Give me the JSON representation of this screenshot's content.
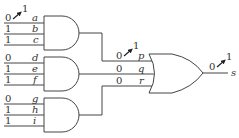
{
  "diagram": {
    "type": "logic-circuit",
    "and_gates": [
      {
        "id": "and-1",
        "inputs": [
          {
            "name": "a",
            "value": "0",
            "changed_to": "1"
          },
          {
            "name": "b",
            "value": "1"
          },
          {
            "name": "c",
            "value": "1"
          }
        ]
      },
      {
        "id": "and-2",
        "inputs": [
          {
            "name": "d",
            "value": "0"
          },
          {
            "name": "e",
            "value": "1"
          },
          {
            "name": "f",
            "value": "1"
          }
        ]
      },
      {
        "id": "and-3",
        "inputs": [
          {
            "name": "g",
            "value": "0"
          },
          {
            "name": "h",
            "value": "1"
          },
          {
            "name": "i",
            "value": "1"
          }
        ]
      }
    ],
    "or_gate": {
      "id": "or-1",
      "inputs": [
        {
          "name": "p",
          "value": "0",
          "changed_to": "1"
        },
        {
          "name": "q",
          "value": "0"
        },
        {
          "name": "r",
          "value": "0"
        }
      ],
      "output": {
        "name": "s",
        "value": "0",
        "changed_to": "1"
      }
    }
  }
}
